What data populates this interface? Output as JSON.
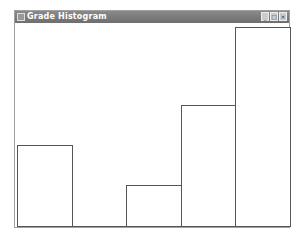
{
  "window": {
    "title": "Grade Histogram",
    "controls": {
      "minimize": "_",
      "maximize": "□",
      "close": "×"
    }
  },
  "chart_data": {
    "type": "bar",
    "title": "Grade Histogram",
    "categories": [
      "1",
      "2",
      "3",
      "4",
      "5"
    ],
    "values": [
      82,
      0,
      42,
      122,
      200
    ],
    "xlabel": "",
    "ylabel": "",
    "grid": false,
    "legend": null
  }
}
